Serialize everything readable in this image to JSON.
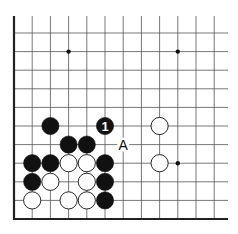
{
  "diagram": {
    "type": "go-board-corner",
    "grid": {
      "origin_x": 14,
      "origin_y": 219,
      "col_spacing": 18.2,
      "row_spacing": 18.6,
      "cols": 12,
      "rows": 11,
      "right_extent": 228,
      "top_extent": 16
    },
    "star_points": [
      {
        "c": 3,
        "r": 9
      },
      {
        "c": 9,
        "r": 9
      },
      {
        "c": 9,
        "r": 3
      }
    ],
    "stones": [
      {
        "color": "black",
        "c": 2,
        "r": 5
      },
      {
        "color": "black",
        "c": 5,
        "r": 5,
        "label": "1"
      },
      {
        "color": "white",
        "c": 8,
        "r": 5
      },
      {
        "color": "black",
        "c": 3,
        "r": 4
      },
      {
        "color": "black",
        "c": 4,
        "r": 4
      },
      {
        "color": "black",
        "c": 1,
        "r": 3
      },
      {
        "color": "black",
        "c": 2,
        "r": 3
      },
      {
        "color": "white",
        "c": 3,
        "r": 3
      },
      {
        "color": "white",
        "c": 4,
        "r": 3
      },
      {
        "color": "black",
        "c": 5,
        "r": 3
      },
      {
        "color": "white",
        "c": 8,
        "r": 3
      },
      {
        "color": "black",
        "c": 1,
        "r": 2
      },
      {
        "color": "white",
        "c": 2,
        "r": 2
      },
      {
        "color": "white",
        "c": 4,
        "r": 2
      },
      {
        "color": "black",
        "c": 5,
        "r": 2
      },
      {
        "color": "white",
        "c": 1,
        "r": 1
      },
      {
        "color": "white",
        "c": 3,
        "r": 1
      },
      {
        "color": "white",
        "c": 4,
        "r": 1
      },
      {
        "color": "black",
        "c": 5,
        "r": 1
      }
    ],
    "markers": [
      {
        "text": "A",
        "c": 6,
        "r": 4
      }
    ],
    "colors": {
      "line": "#555555",
      "edge": "#222222",
      "black_stone": "#111111",
      "white_stone": "#ffffff"
    }
  }
}
